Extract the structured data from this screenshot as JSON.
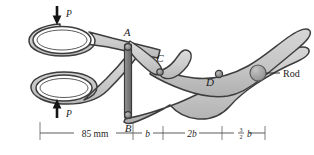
{
  "figure": {
    "background_color": "#ffffff",
    "body_fill": "#c9c9c9",
    "body_fill_light": "#d8d8d8",
    "outline_color": "#3d3d3d",
    "pin_color": "#8f8f8f",
    "rod_color": "#a8a8a8",
    "label_color": "#1a1a1a"
  },
  "points": [
    {
      "id": "A",
      "label": "A",
      "x": 127,
      "y": 36
    },
    {
      "id": "B",
      "label": "B",
      "x": 128,
      "y": 119
    },
    {
      "id": "C",
      "label": "C",
      "x": 160,
      "y": 62
    },
    {
      "id": "D",
      "label": "D",
      "x": 212,
      "y": 82
    }
  ],
  "forces": [
    {
      "id": "P-top",
      "label": "P",
      "direction": "down",
      "x": 57,
      "y": 8
    },
    {
      "id": "P-bottom",
      "label": "P",
      "direction": "up",
      "x": 57,
      "y": 107
    }
  ],
  "annotations": [
    {
      "id": "rod",
      "label": "Rod",
      "x": 283,
      "y": 73
    }
  ],
  "dimensions": {
    "baseline_y": 133,
    "segments": [
      {
        "id": "seg-1",
        "label": "85 mm",
        "italic": false,
        "fraction": null,
        "x_start": 40,
        "x_end": 133
      },
      {
        "id": "seg-2",
        "label": "b",
        "italic": true,
        "fraction": null,
        "x_start": 133,
        "x_end": 163
      },
      {
        "id": "seg-3",
        "label": "2b",
        "italic": true,
        "fraction": null,
        "x_start": 163,
        "x_end": 222
      },
      {
        "id": "seg-4",
        "label": "b",
        "italic": true,
        "fraction": {
          "numerator": "3",
          "denominator": "2"
        },
        "x_start": 222,
        "x_end": 265
      }
    ]
  }
}
